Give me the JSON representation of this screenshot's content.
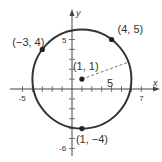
{
  "chart_data": {
    "type": "scatter",
    "title": "",
    "xlabel": "x",
    "ylabel": "y",
    "xlim": [
      -6,
      8
    ],
    "ylim": [
      -6.5,
      6.5
    ],
    "grid": false,
    "x_tick_labels": [
      {
        "value": -5,
        "label": "-5"
      },
      {
        "value": 7,
        "label": "7"
      }
    ],
    "y_tick_labels": [
      {
        "value": 5,
        "label": "5"
      },
      {
        "value": -6,
        "label": "-6"
      }
    ],
    "x_ticks": [
      -5,
      -4,
      -3,
      -2,
      -1,
      1,
      2,
      3,
      4,
      5,
      6,
      7
    ],
    "y_ticks": [
      -6,
      -5,
      -4,
      -3,
      -2,
      -1,
      1,
      2,
      3,
      4,
      5
    ],
    "circle": {
      "center": [
        1,
        1
      ],
      "radius": 5
    },
    "radius_label": "5",
    "radius_angle_deg": 20,
    "points": [
      {
        "x": -3,
        "y": 4,
        "label": "(−3, 4)"
      },
      {
        "x": 4,
        "y": 5,
        "label": "(4, 5)"
      },
      {
        "x": 1,
        "y": 1,
        "label": "(1, 1)"
      },
      {
        "x": 1,
        "y": -4,
        "label": "(1, −4)"
      }
    ],
    "colors": {
      "stroke": "#333333",
      "background": "#ffffff"
    }
  }
}
